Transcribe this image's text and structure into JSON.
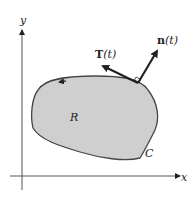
{
  "diagram": {
    "axes": {
      "x_label": "x",
      "y_label": "y"
    },
    "region_label": "R",
    "curve_label": "C",
    "tangent_label": "T(t)",
    "normal_label": "n(t)",
    "tangent_bold": "T",
    "normal_bold": "n",
    "param": "(t)",
    "colors": {
      "region_fill": "#cfcfcf",
      "stroke": "#333333",
      "background": "#ffffff"
    }
  }
}
